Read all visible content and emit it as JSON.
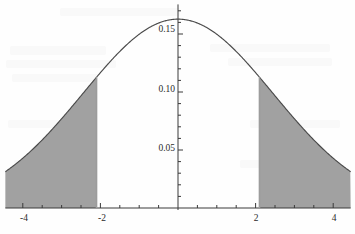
{
  "chart_data": {
    "type": "area",
    "title": "",
    "subtitle": "",
    "xlabel": "",
    "ylabel": "",
    "xlim": [
      -4.45,
      4.45
    ],
    "ylim": [
      0,
      0.1755
    ],
    "grid": false,
    "legend": null,
    "curve": {
      "name": "normal density",
      "mean": 0,
      "sigma": 2.45,
      "peak_value": 0.1628,
      "peak_x": 0
    },
    "x_ticks_major": [
      -4,
      -2,
      2,
      4
    ],
    "x_tick_labels": [
      "-4",
      "-2",
      "2",
      "4"
    ],
    "x_ticks_minor_step": 0.5,
    "y_ticks_major": [
      0.05,
      0.1,
      0.15
    ],
    "y_tick_labels": [
      "0.05",
      "0.10",
      "0.15"
    ],
    "y_ticks_minor_step": 0.01,
    "shaded_regions": [
      {
        "name": "left-tail",
        "from": -4.45,
        "to": -2.1,
        "fill": "#9c9c9c"
      },
      {
        "name": "right-tail",
        "from": 2.1,
        "to": 4.45,
        "fill": "#9c9c9c"
      }
    ],
    "critical_values": [
      -2.1,
      2.1
    ],
    "axis_color": "#3a3a3a",
    "curve_color": "#4a4a4a",
    "shade_color": "#9c9c9c",
    "background_color": "#fefefe",
    "x_points": [
      -4.45,
      -4.2,
      -4,
      -3.8,
      -3.6,
      -3.4,
      -3.2,
      -3,
      -2.8,
      -2.6,
      -2.4,
      -2.2,
      -2.1,
      -2,
      -1.8,
      -1.6,
      -1.4,
      -1.2,
      -1,
      -0.8,
      -0.6,
      -0.4,
      -0.2,
      0,
      0.2,
      0.4,
      0.6,
      0.8,
      1,
      1.2,
      1.4,
      1.6,
      1.8,
      2,
      2.1,
      2.2,
      2.4,
      2.6,
      2.8,
      3,
      3.2,
      3.4,
      3.6,
      3.8,
      4,
      4.2,
      4.45
    ],
    "y_points": [
      0.0313,
      0.0369,
      0.0414,
      0.0462,
      0.0511,
      0.0562,
      0.0615,
      0.0668,
      0.0722,
      0.0777,
      0.0831,
      0.0884,
      0.091,
      0.0936,
      0.0986,
      0.1033,
      0.1076,
      0.1116,
      0.1151,
      0.1181,
      0.1206,
      0.1224,
      0.1236,
      0.124,
      0.1236,
      0.1224,
      0.1206,
      0.1181,
      0.1151,
      0.1116,
      0.1076,
      0.1033,
      0.0986,
      0.0936,
      0.091,
      0.0884,
      0.0831,
      0.0777,
      0.0722,
      0.0668,
      0.0615,
      0.0562,
      0.0511,
      0.0462,
      0.0414,
      0.0369,
      0.0313
    ]
  },
  "axes": {
    "y_tick_0_05": "0.05",
    "y_tick_0_10": "0.10",
    "y_tick_0_15": "0.15",
    "x_tick_neg4": "-4",
    "x_tick_neg2": "-2",
    "x_tick_pos2": "2",
    "x_tick_pos4": "4"
  }
}
